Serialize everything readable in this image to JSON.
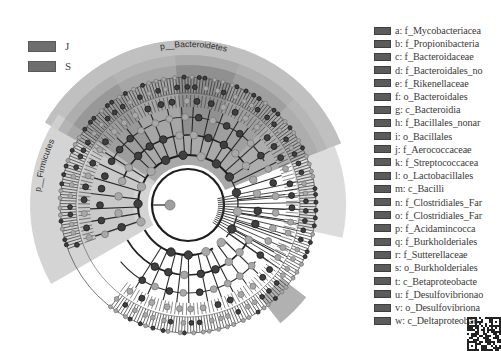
{
  "figure": {
    "type": "LEfSe cladogram",
    "center": [
      188,
      205
    ],
    "group_legend": [
      {
        "label": "J",
        "color": "#6e6e6e"
      },
      {
        "label": "S",
        "color": "#6e6e6e"
      }
    ],
    "clade_labels": [
      {
        "text": "p__Bacteroidetes",
        "angle_deg": -85,
        "radius": 158
      },
      {
        "text": "p__Firmicutes",
        "angle_deg": 200,
        "radius": 148
      }
    ],
    "highlight_wedges": [
      {
        "name": "p__Bacteroidetes",
        "start": -150,
        "end": -22,
        "r0": 40,
        "r1": 165,
        "fill": "#9a9a9a",
        "opacity": 0.85
      },
      {
        "name": "p__Firmicutes",
        "start": 150,
        "end": 215,
        "r0": 40,
        "r1": 158,
        "fill": "#cfcfcf",
        "opacity": 0.9
      },
      {
        "name": "right-light",
        "start": -22,
        "end": 12,
        "r0": 110,
        "r1": 158,
        "fill": "#d8d8d8",
        "opacity": 0.9
      },
      {
        "name": "lower-right",
        "start": 38,
        "end": 52,
        "r0": 118,
        "r1": 150,
        "fill": "#a8a8a8",
        "opacity": 0.9
      }
    ],
    "node_rings": [
      50,
      70,
      88,
      104,
      118,
      128
    ],
    "leaf_ring": {
      "r0": 112,
      "r1": 128,
      "count": 240
    }
  },
  "legend": {
    "items": [
      {
        "key": "a",
        "label": "a: f_Mycobacteriacea"
      },
      {
        "key": "b",
        "label": "b: f_Propionibacteria"
      },
      {
        "key": "c",
        "label": "c: f_Bacteroidaceae"
      },
      {
        "key": "d",
        "label": "d: f_Bacteroidales_no"
      },
      {
        "key": "e",
        "label": "e: f_Rikenellaceae"
      },
      {
        "key": "f",
        "label": "f: o_Bacteroidales"
      },
      {
        "key": "g",
        "label": "g: c_Bacteroidia"
      },
      {
        "key": "h",
        "label": "h: f_Bacillales_nonar"
      },
      {
        "key": "i",
        "label": "i: o_Bacillales"
      },
      {
        "key": "j",
        "label": "j: f_Aerococcaceae"
      },
      {
        "key": "k",
        "label": "k: f_Streptococcacea"
      },
      {
        "key": "l",
        "label": "l: o_Lactobacillales"
      },
      {
        "key": "m",
        "label": "m: c_Bacilli"
      },
      {
        "key": "n",
        "label": "n: f_Clostridiales_Far"
      },
      {
        "key": "o",
        "label": "o: f_Clostridiales_Far"
      },
      {
        "key": "p",
        "label": "p: f_Acidamincocca"
      },
      {
        "key": "q",
        "label": "q: f_Burkholderiales"
      },
      {
        "key": "r",
        "label": "r: f_Sutterellaceae"
      },
      {
        "key": "s",
        "label": "s: o_Burkholderiales"
      },
      {
        "key": "t",
        "label": "t: c_Betaproteobacte"
      },
      {
        "key": "u",
        "label": "u: f_Desulfovibrionao"
      },
      {
        "key": "v",
        "label": "v: o_Desulfovibriona"
      },
      {
        "key": "w",
        "label": "w: c_Deltaproteobac"
      }
    ]
  },
  "qr_code": {
    "present": true
  }
}
